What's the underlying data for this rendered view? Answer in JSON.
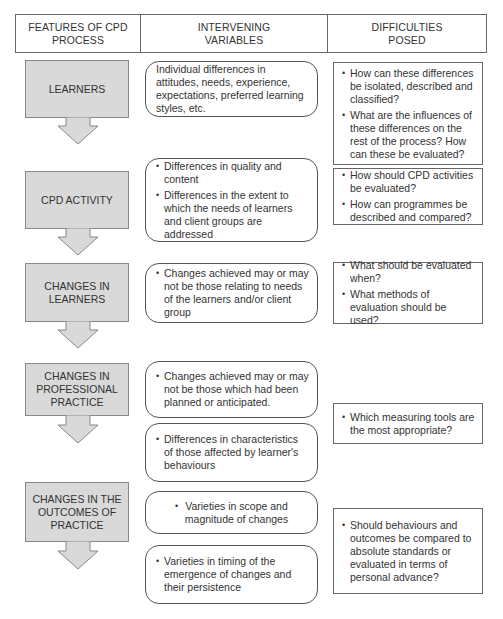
{
  "header": {
    "col1": "FEATURES OF CPD\nPROCESS",
    "col2": "INTERVENING\nVARIABLES",
    "col3": "DIFFICULTIES\nPOSED"
  },
  "features": [
    {
      "label": "LEARNERS"
    },
    {
      "label": "CPD ACTIVITY"
    },
    {
      "label": "CHANGES IN\nLEARNERS"
    },
    {
      "label": "CHANGES IN\nPROFESSIONAL\nPRACTICE"
    },
    {
      "label": "CHANGES IN THE\nOUTCOMES OF\nPRACTICE"
    }
  ],
  "variables": [
    {
      "text": "Individual differences in attitudes, needs, experience, expectations, preferred learning styles, etc."
    },
    {
      "items": [
        "Differences in quality and content",
        "Differences in the extent to which the needs of learners and client groups are addressed"
      ]
    },
    {
      "items": [
        "Changes achieved may or may not be those relating to needs of the learners and/or client group"
      ]
    },
    {
      "items": [
        "Changes achieved may or may not be those which had been planned or anticipated."
      ]
    },
    {
      "items": [
        "Differences in characteristics of those affected by learner's behaviours"
      ]
    },
    {
      "items": [
        "Varieties in scope and magnitude of changes"
      ]
    },
    {
      "items": [
        "Varieties in timing of the emergence of changes and their persistence"
      ]
    }
  ],
  "difficulties": [
    {
      "items": [
        "How can these differences be isolated, described and classified?",
        "What are the influences of these differences on the rest of the process? How can these be evaluated?"
      ]
    },
    {
      "items": [
        "How should CPD activities be evaluated?",
        "How can programmes be described and compared?"
      ]
    },
    {
      "items": [
        "What should be evaluated when?",
        "What methods of evaluation should be used?"
      ]
    },
    {
      "items": [
        "Which measuring tools are the most appropriate?"
      ]
    },
    {
      "items": [
        "Should behaviours and outcomes be compared to absolute standards or evaluated in terms of personal advance?"
      ]
    }
  ],
  "bullet_glyph": "•",
  "colors": {
    "feature_fill": "#d9d9d9",
    "border": "#666666"
  }
}
